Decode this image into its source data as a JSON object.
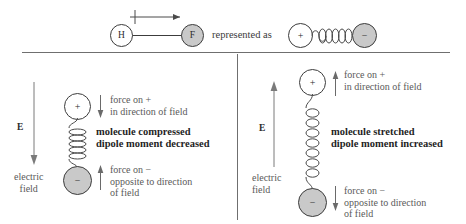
{
  "figure": {
    "title_top": {
      "atom_left": "H",
      "atom_right": "F",
      "dipole_arrow": "dipole-moment-arrow",
      "represented_as": "represented as",
      "model_positive": "+",
      "model_negative": "−"
    },
    "panels": [
      {
        "id": "compressed",
        "field": {
          "symbol": "E",
          "label_line1": "electric",
          "label_line2": "field",
          "direction": "down"
        },
        "molecule": {
          "positive_charge": "+",
          "negative_charge": "−",
          "spring_state": "compressed"
        },
        "force_top": {
          "arrow_direction": "down",
          "line1": "force on  +",
          "line2": "in direction of field"
        },
        "force_bottom": {
          "arrow_direction": "up",
          "line1": "force on  −",
          "line2": "opposite to direction",
          "line3": "of field"
        },
        "caption": {
          "line1": "molecule compressed",
          "line2": "dipole moment decreased"
        }
      },
      {
        "id": "stretched",
        "field": {
          "symbol": "E",
          "label_line1": "electric",
          "label_line2": "field",
          "direction": "up"
        },
        "molecule": {
          "positive_charge": "+",
          "negative_charge": "−",
          "spring_state": "stretched"
        },
        "force_top": {
          "arrow_direction": "up",
          "line1": "force on  +",
          "line2": "in direction of field"
        },
        "force_bottom": {
          "arrow_direction": "down",
          "line1": "force on  −",
          "line2": "opposite to direction",
          "line3": "of field"
        },
        "caption": {
          "line1": "molecule stretched",
          "line2": "dipole moment increased"
        }
      }
    ],
    "colors": {
      "stroke": "#3c3c3c",
      "gray_fill": "#c9c9c9",
      "text": "#5a5a5a",
      "bold_text": "#1f1f1f",
      "divider": "#6f6f6f"
    }
  }
}
